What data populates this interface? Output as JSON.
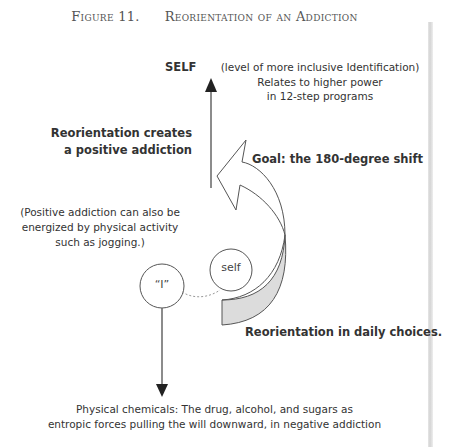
{
  "figure": {
    "label": "Figure 11.",
    "title": "Reorientation of an Addiction"
  },
  "top": {
    "self_label": "SELF",
    "self_description": [
      "(level of more inclusive Identification)",
      "Relates to higher power",
      "in 12-step programs"
    ]
  },
  "left": {
    "reorientation_heading": [
      "Reorientation creates",
      "a positive addiction"
    ],
    "positive_note": [
      "(Positive addiction can also be",
      "energized by physical activity",
      "such as jogging.)"
    ]
  },
  "curved_arrow": {
    "goal_label": "Goal: the 180-degree shift",
    "base_label": "Reorientation in daily choices.",
    "fill_color": "#dcdcdc",
    "stroke_color": "#555555"
  },
  "nodes": {
    "i_node": "“I”",
    "self_node": "self"
  },
  "bottom": {
    "chemicals_note": [
      "Physical chemicals: The drug, alcohol, and sugars as",
      "entropic forces pulling the will downward, in negative addiction"
    ]
  }
}
